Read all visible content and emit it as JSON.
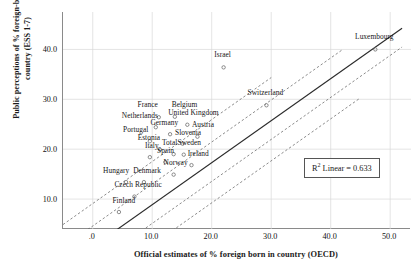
{
  "chart_data": {
    "type": "scatter",
    "title": "",
    "xlabel": "Official estimates of % foreign born in country (OECD)",
    "ylabel_line1": "Public perceptions of % foreign-born in",
    "ylabel_line2": "country (ESS 1-7)",
    "xlim": [
      -5.0,
      53.5
    ],
    "ylim": [
      4.0,
      47.5
    ],
    "xticks": [
      ".0",
      "10.0",
      "20.0",
      "30.0",
      "40.0",
      "50.0"
    ],
    "xtick_values": [
      0,
      10,
      20,
      30,
      40,
      50
    ],
    "yticks": [
      "10.0",
      "20.0",
      "30.0",
      "40.0"
    ],
    "ytick_values": [
      10,
      20,
      30,
      40
    ],
    "grid": true,
    "legend": "none",
    "annotation": {
      "r2_prefix": "R",
      "r2_exponent": "2",
      "r2_text": " Linear = 0.633",
      "r2_value": 0.633
    },
    "fit_line": {
      "type": "linear-regression",
      "style": "solid",
      "slope": 0.842,
      "intercept": 0.45,
      "x_start": -1.0,
      "x_end": 52.0
    },
    "confidence_bands": [
      {
        "name": "upper-outer",
        "style": "dashed",
        "slope": 0.842,
        "intercept": 9.1,
        "x_start": -5.0,
        "x_end": 30.0
      },
      {
        "name": "upper-inner",
        "style": "dashed",
        "slope": 0.842,
        "intercept": 4.6,
        "x_start": -4.0,
        "x_end": 42.0
      },
      {
        "name": "lower-inner",
        "style": "dashed",
        "slope": 0.842,
        "intercept": -3.3,
        "x_start": 4.5,
        "x_end": 52.0
      },
      {
        "name": "lower-outer",
        "style": "dashed",
        "slope": 0.842,
        "intercept": -7.6,
        "x_start": 9.0,
        "x_end": 45.0
      }
    ],
    "points": [
      {
        "label": "Luxembourg",
        "x": 47.5,
        "y": 40.0,
        "lx": 47.5,
        "ly": 41.6,
        "anchor": "center"
      },
      {
        "label": "Israel",
        "x": 22.0,
        "y": 36.4,
        "lx": 22.0,
        "ly": 38.0,
        "anchor": "center"
      },
      {
        "label": "Switzerland",
        "x": 29.2,
        "y": 28.8,
        "lx": 29.2,
        "ly": 30.4,
        "anchor": "center"
      },
      {
        "label": "France",
        "x": 11.1,
        "y": 26.4,
        "lx": 9.4,
        "ly": 28.0,
        "anchor": "center"
      },
      {
        "label": "Belgium",
        "x": 13.8,
        "y": 26.5,
        "lx": 15.6,
        "ly": 28.1,
        "anchor": "center"
      },
      {
        "label": "United Kingdom",
        "x": 15.9,
        "y": 24.9,
        "lx": 17.1,
        "ly": 26.4,
        "anchor": "center"
      },
      {
        "label": "Netherlands",
        "x": 10.6,
        "y": 24.4,
        "lx": 8.1,
        "ly": 25.9,
        "anchor": "center"
      },
      {
        "label": "Germany",
        "x": 13.0,
        "y": 23.0,
        "lx": 12.2,
        "ly": 24.5,
        "anchor": "center"
      },
      {
        "label": "Austria",
        "x": 17.6,
        "y": 22.5,
        "lx": 18.7,
        "ly": 24.0,
        "anchor": "center"
      },
      {
        "label": "Portugal",
        "x": 9.6,
        "y": 21.6,
        "lx": 7.4,
        "ly": 23.1,
        "anchor": "center"
      },
      {
        "label": "Slovenia",
        "x": 15.1,
        "y": 21.1,
        "lx": 16.2,
        "ly": 22.5,
        "anchor": "center"
      },
      {
        "label": "Estonia",
        "x": 11.3,
        "y": 19.9,
        "lx": 9.6,
        "ly": 21.4,
        "anchor": "center"
      },
      {
        "label": "Total",
        "x": 13.6,
        "y": 19.0,
        "lx": 13.1,
        "ly": 20.4,
        "anchor": "center"
      },
      {
        "label": "Sweden",
        "x": 15.3,
        "y": 18.9,
        "lx": 16.4,
        "ly": 20.4,
        "anchor": "center"
      },
      {
        "label": "Italy",
        "x": 9.6,
        "y": 18.4,
        "lx": 10.1,
        "ly": 19.8,
        "anchor": "center"
      },
      {
        "label": "Spain",
        "x": 12.2,
        "y": 17.4,
        "lx": 12.4,
        "ly": 18.8,
        "anchor": "center"
      },
      {
        "label": "Ireland",
        "x": 16.6,
        "y": 16.8,
        "lx": 17.9,
        "ly": 18.2,
        "anchor": "center"
      },
      {
        "label": "Norway",
        "x": 13.6,
        "y": 14.9,
        "lx": 14.1,
        "ly": 16.4,
        "anchor": "center"
      },
      {
        "label": "Hungary",
        "x": 5.6,
        "y": 13.4,
        "lx": 4.1,
        "ly": 14.9,
        "anchor": "center"
      },
      {
        "label": "Denmark",
        "x": 8.6,
        "y": 13.4,
        "lx": 9.3,
        "ly": 14.8,
        "anchor": "center"
      },
      {
        "label": "Czech Republic",
        "x": 7.0,
        "y": 10.5,
        "lx": 7.8,
        "ly": 12.0,
        "anchor": "center"
      },
      {
        "label": "Finland",
        "x": 4.4,
        "y": 7.4,
        "lx": 5.4,
        "ly": 8.9,
        "anchor": "center"
      }
    ]
  }
}
